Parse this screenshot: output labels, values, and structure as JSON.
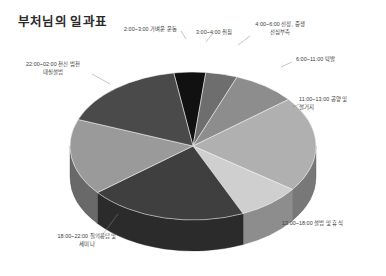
{
  "title": "부처님의 일과표",
  "chart_data": {
    "type": "pie",
    "title": "부처님의 일과표",
    "xlabel": "",
    "ylabel": "",
    "unit": "시간",
    "total": 24,
    "legend_position": "callout-labels",
    "grid": false,
    "three_d": true,
    "categories": [
      "2:00~3:00 가벼운 운동",
      "3:00~4:00 취침",
      "4:00~6:00 선정, 중생 선심부촉",
      "6:00~11:00 탁발",
      "11:00~13:00 공양 및 설거지",
      "13:00~18:00 설법 및 휴식",
      "18:00~22:00 질의응답 및 세미나",
      "22:00~02:00 천신 범천 대실설법"
    ],
    "values": [
      1,
      1,
      2,
      5,
      2,
      5,
      4,
      4
    ],
    "colors": [
      "#111111",
      "#6e6e6e",
      "#8d8d8d",
      "#b0b0b0",
      "#cfcfcf",
      "#3f3f3f",
      "#9a9a9a",
      "#4a4a4a"
    ],
    "slices": [
      {
        "label": "2:00~3:00 가벼운 운동",
        "hours": 1,
        "color": "#111111"
      },
      {
        "label": "3:00~4:00 취침",
        "hours": 1,
        "color": "#6e6e6e"
      },
      {
        "label": "4:00~6:00 선정, 중생 선심부촉",
        "hours": 2,
        "color": "#8d8d8d"
      },
      {
        "label": "6:00~11:00 탁발",
        "hours": 5,
        "color": "#b0b0b0"
      },
      {
        "label": "11:00~13:00 공양 및 설거지",
        "hours": 2,
        "color": "#cfcfcf"
      },
      {
        "label": "13:00~18:00 설법 및 휴식",
        "hours": 5,
        "color": "#3f3f3f"
      },
      {
        "label": "18:00~22:00 질의응답 및 세미나",
        "hours": 4,
        "color": "#9a9a9a"
      },
      {
        "label": "22:00~02:00 천신 범천 대실설법",
        "hours": 4,
        "color": "#4a4a4a"
      }
    ]
  },
  "labels": {
    "exercise": "2:00~3:00 가벼운 운동",
    "sleep": "3:00~4:00 취침",
    "meditation_l1": "4:00~6:00 선정, 중생",
    "meditation_l2": "선심부촉",
    "alms": "6:00~11:00 탁발",
    "meal_l1": "11:00~13:00 공양 및",
    "meal_l2": "설거지",
    "teaching": "13:00~18:00 설법 및 휴식",
    "qna_l1": "18:00~22:00 질의응답 및",
    "qna_l2": "세미나",
    "devas_l1": "22:00~02:00 천신 범천",
    "devas_l2": "대실설법"
  }
}
